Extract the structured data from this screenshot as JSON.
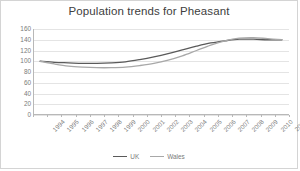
{
  "chart_data": {
    "type": "line",
    "title": "Population trends for Pheasant",
    "xlabel": "",
    "ylabel": "",
    "ylim": [
      0,
      160
    ],
    "ytick_step": 20,
    "yticks": [
      160,
      140,
      120,
      100,
      80,
      60,
      40,
      20,
      0
    ],
    "grid": true,
    "legend_position": "bottom",
    "categories": [
      "1994",
      "1995",
      "1996",
      "1997",
      "1998",
      "1999",
      "2000",
      "2001",
      "2002",
      "2003",
      "2004",
      "2005",
      "2006",
      "2007",
      "2008",
      "2009",
      "2010",
      "2011"
    ],
    "series": [
      {
        "name": "UK",
        "color": "#5a5a5a",
        "values": [
          100,
          98,
          97,
          96,
          96,
          97,
          99,
          103,
          108,
          114,
          121,
          128,
          134,
          138,
          141,
          141,
          140,
          140
        ]
      },
      {
        "name": "Wales",
        "color": "#a8a8a8",
        "values": [
          100,
          95,
          91,
          89,
          88,
          88,
          89,
          92,
          96,
          102,
          110,
          120,
          130,
          138,
          143,
          144,
          142,
          140
        ]
      }
    ]
  },
  "legend": {
    "items": [
      {
        "label": "UK"
      },
      {
        "label": "Wales"
      }
    ]
  },
  "colors": {
    "border": "#d4d4d4",
    "gridline": "#e4e4e4",
    "axis": "#b8b8b8",
    "title_text": "#404040",
    "tick_text": "#7a7a7a"
  }
}
